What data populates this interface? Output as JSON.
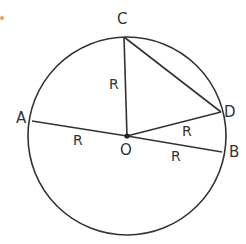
{
  "diagram": {
    "type": "circle-geometry",
    "colors": {
      "stroke": "#333333",
      "background": "#ffffff",
      "marker": "#f0a040"
    },
    "circle": {
      "cx": 127,
      "cy": 136,
      "r": 99
    },
    "points": {
      "A": {
        "label": "A",
        "x": 32,
        "y": 121
      },
      "B": {
        "label": "B",
        "x": 222,
        "y": 152
      },
      "C": {
        "label": "C",
        "x": 124,
        "y": 37
      },
      "D": {
        "label": "D",
        "x": 221,
        "y": 112
      },
      "O": {
        "label": "O",
        "x": 127,
        "y": 136
      }
    },
    "segments": [
      {
        "from": "A",
        "to": "O",
        "label": "R"
      },
      {
        "from": "O",
        "to": "B",
        "label": "R"
      },
      {
        "from": "O",
        "to": "C",
        "label": "R"
      },
      {
        "from": "O",
        "to": "D",
        "label": "R"
      },
      {
        "from": "C",
        "to": "D",
        "label": ""
      }
    ],
    "radius_label": "R"
  }
}
